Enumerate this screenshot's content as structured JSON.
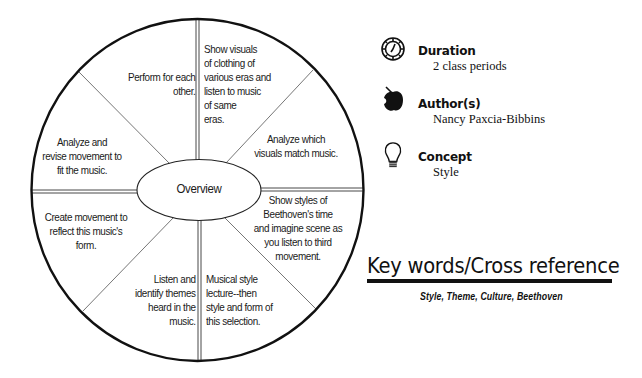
{
  "wheel": {
    "center_label": "Overview",
    "segments": [
      {
        "position": "top-left",
        "lines": [
          "Perform for each",
          "other."
        ]
      },
      {
        "position": "top-right",
        "lines": [
          "Show visuals",
          "of clothing of",
          "various eras and",
          "listen to music",
          "of same",
          "eras."
        ]
      },
      {
        "position": "right-upper",
        "lines": [
          "Analyze which",
          "visuals match music."
        ]
      },
      {
        "position": "right-lower",
        "lines": [
          "Show styles of",
          "Beethoven's time",
          "and imagine scene as",
          "you listen to third",
          "movement."
        ]
      },
      {
        "position": "bottom-right",
        "lines": [
          "Musical style",
          "lecture--then",
          "style and form of",
          "this selection."
        ]
      },
      {
        "position": "bottom-left",
        "lines": [
          "Listen and",
          "identify themes",
          "heard in the",
          "music."
        ]
      },
      {
        "position": "left-lower",
        "lines": [
          "Create movement to",
          "reflect this music's",
          "form."
        ]
      },
      {
        "position": "left-upper",
        "lines": [
          "Analyze and",
          "revise movement to",
          "fit the music."
        ]
      }
    ]
  },
  "info": {
    "duration": {
      "icon": "clock-badge-icon",
      "title": "Duration",
      "value": "2 class periods"
    },
    "authors": {
      "icon": "apple-icon",
      "title": "Author(s)",
      "value": "Nancy Paxcia-Bibbins"
    },
    "concept": {
      "icon": "lightbulb-icon",
      "title": "Concept",
      "value": "Style"
    }
  },
  "keywords": {
    "heading": "Key words/Cross reference",
    "list": "Style, Theme, Culture, Beethoven"
  },
  "colors": {
    "ink": "#111111",
    "divider": "#555555",
    "background": "#ffffff"
  }
}
